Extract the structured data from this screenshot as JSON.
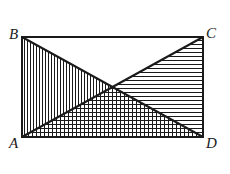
{
  "figure": {
    "kind": "geometry-diagram",
    "stroke_color": "#1a1a1a",
    "background_color": "#ffffff",
    "hatch_color": "#1a1a1a",
    "outline_width": 2,
    "diagonal_width": 2,
    "hatch_width": 1,
    "rectangle": {
      "left": 22,
      "top": 37,
      "right": 203,
      "bottom": 137,
      "width": 181,
      "height": 100
    },
    "vertices": [
      {
        "name": "B",
        "label": "B",
        "x": 22,
        "y": 37,
        "position": "top-left"
      },
      {
        "name": "C",
        "label": "C",
        "x": 203,
        "y": 37,
        "position": "top-right"
      },
      {
        "name": "A",
        "label": "A",
        "x": 22,
        "y": 137,
        "position": "bottom-left"
      },
      {
        "name": "D",
        "label": "D",
        "x": 203,
        "y": 137,
        "position": "bottom-right"
      }
    ],
    "diagonals": [
      {
        "name": "diagonal-BD",
        "from": "B",
        "to": "D"
      },
      {
        "name": "diagonal-AC",
        "from": "A",
        "to": "C"
      }
    ],
    "center": {
      "name": "diagonal-intersection",
      "x": 112.5,
      "y": 87
    },
    "regions": [
      {
        "name": "triangle-ABO-left",
        "vertices": "A, B, center",
        "fill": "vertical-hatch",
        "hatch_spacing": 3
      },
      {
        "name": "triangle-BCO-top",
        "vertices": "B, C, center",
        "fill": "none",
        "hatch_spacing": 0
      },
      {
        "name": "triangle-CDO-right",
        "vertices": "C, D, center",
        "fill": "horizontal-hatch",
        "hatch_spacing": 4
      },
      {
        "name": "triangle-ADO-bottom",
        "vertices": "A, D, center",
        "fill": "cross-hatch",
        "hatch_spacing": 4
      }
    ]
  }
}
